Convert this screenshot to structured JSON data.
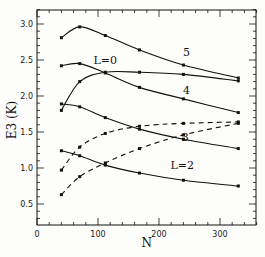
{
  "chart_data": {
    "type": "line",
    "title": "",
    "xlabel": "N",
    "ylabel": "E3 (K)",
    "xlim": [
      0,
      360
    ],
    "ylim": [
      0.25,
      3.2
    ],
    "xticks": [
      0,
      100,
      200,
      300
    ],
    "yticks": [
      0.5,
      1.0,
      1.5,
      2.0,
      2.5,
      3.0
    ],
    "xtick_labels": [
      "0",
      "100",
      "200",
      "300"
    ],
    "ytick_labels": [
      "0.5",
      "1.0",
      "1.5",
      "2.0",
      "2.5",
      "3.0"
    ],
    "grid": false,
    "legend": "none (inline annotations)",
    "x": [
      40,
      70,
      112,
      168,
      240,
      330
    ],
    "series": [
      {
        "name": "L=5",
        "style": "solid",
        "values": [
          2.81,
          2.96,
          2.84,
          2.64,
          2.43,
          2.25
        ]
      },
      {
        "name": "L=0",
        "style": "solid",
        "values": [
          1.8,
          2.2,
          2.33,
          2.33,
          2.3,
          2.21
        ]
      },
      {
        "name": "L=4",
        "style": "solid",
        "values": [
          2.42,
          2.45,
          2.32,
          2.12,
          1.96,
          1.77
        ]
      },
      {
        "name": "solid-lower",
        "style": "solid",
        "values": [
          1.89,
          1.85,
          1.7,
          1.54,
          1.4,
          1.27
        ]
      },
      {
        "name": "dashed-upper",
        "style": "dashed",
        "values": [
          0.97,
          1.29,
          1.48,
          1.58,
          1.62,
          1.64
        ]
      },
      {
        "name": "L=3",
        "style": "dashed",
        "values": [
          0.63,
          0.88,
          1.07,
          1.27,
          1.46,
          1.62
        ]
      },
      {
        "name": "L=2",
        "style": "solid",
        "values": [
          1.24,
          1.17,
          1.04,
          0.93,
          0.83,
          0.75
        ]
      }
    ],
    "annotations": [
      {
        "text": "5",
        "x": 245,
        "y": 2.55
      },
      {
        "text": "L=0",
        "x": 112,
        "y": 2.45
      },
      {
        "text": "4",
        "x": 245,
        "y": 2.03
      },
      {
        "text": "3",
        "x": 243,
        "y": 1.38
      },
      {
        "text": "L=2",
        "x": 238,
        "y": 0.98
      }
    ]
  }
}
